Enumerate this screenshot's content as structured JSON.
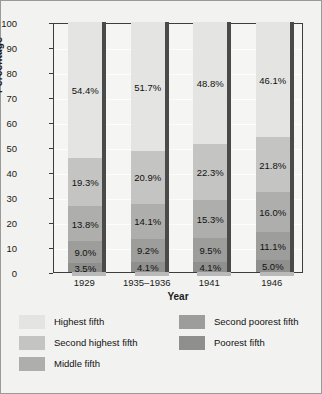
{
  "chart_data": {
    "type": "bar",
    "subtype": "stacked-100-percent",
    "title": "",
    "xlabel": "Year",
    "ylabel": "Percentage",
    "ylim": [
      0,
      100
    ],
    "ytick_step": 10,
    "grid": true,
    "legend_position": "bottom",
    "categories": [
      "1929",
      "1935–1936",
      "1941",
      "1946"
    ],
    "yticks": [
      "100",
      "90",
      "80",
      "70",
      "60",
      "50",
      "40",
      "30",
      "20",
      "10",
      "0"
    ],
    "series": [
      {
        "name": "Highest fifth",
        "color": "#e4e4e2",
        "values": [
          54.4,
          51.7,
          48.8,
          46.1
        ],
        "labels": [
          "54.4%",
          "51.7%",
          "48.8%",
          "46.1%"
        ]
      },
      {
        "name": "Second highest fifth",
        "color": "#c4c4c2",
        "values": [
          19.3,
          20.9,
          22.3,
          21.8
        ],
        "labels": [
          "19.3%",
          "20.9%",
          "22.3%",
          "21.8%"
        ]
      },
      {
        "name": "Middle fifth",
        "color": "#aeaeac",
        "values": [
          13.8,
          14.1,
          15.3,
          16.0
        ],
        "labels": [
          "13.8%",
          "14.1%",
          "15.3%",
          "16.0%"
        ]
      },
      {
        "name": "Second poorest fifth",
        "color": "#9d9d9b",
        "values": [
          9.0,
          9.2,
          9.5,
          11.1
        ],
        "labels": [
          "9.0%",
          "9.2%",
          "9.5%",
          "11.1%"
        ]
      },
      {
        "name": "Poorest fifth",
        "color": "#8f8f8d",
        "values": [
          3.5,
          4.1,
          4.1,
          5.0
        ],
        "labels": [
          "3.5%",
          "4.1%",
          "4.1%",
          "5.0%"
        ]
      }
    ]
  },
  "legend": {
    "left_column": [
      "Highest fifth",
      "Second highest fifth",
      "Middle fifth"
    ],
    "right_column": [
      "Second poorest fifth",
      "Poorest fifth"
    ]
  }
}
